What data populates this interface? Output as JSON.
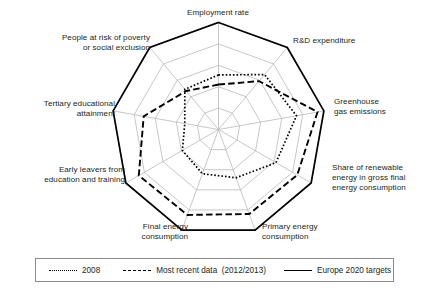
{
  "chart_data": {
    "type": "radar",
    "title": "",
    "axes": [
      "Employment rate",
      "R&D expenditure",
      "Greenhouse\ngas emissions",
      "Share of renewable\nenergy in gross final\nenergy consumption",
      "Primary energy\nconsumption",
      "Final energy\nconsumption",
      "Early leavers from\neducation and training",
      "Tertiary educational\nattainment",
      "People at risk of poverty\nor social exclusion"
    ],
    "rlim": [
      0,
      100
    ],
    "grid": true,
    "grid_rings": [
      20,
      40,
      60,
      80,
      100
    ],
    "legend_position": "bottom",
    "series": [
      {
        "name": "2008",
        "style": "dotted",
        "color": "#000000",
        "values": [
          51,
          67,
          74,
          62,
          48,
          44,
          39,
          32,
          49
        ]
      },
      {
        "name": "Most recent data  (2012/2013)",
        "style": "dashed",
        "color": "#000000",
        "values": [
          42,
          59,
          94,
          85,
          84,
          85,
          86,
          71,
          47
        ]
      },
      {
        "name": "Europe 2020 targets",
        "style": "solid",
        "color": "#000000",
        "values": [
          100,
          100,
          100,
          100,
          100,
          100,
          100,
          100,
          100
        ]
      }
    ]
  },
  "legend": {
    "items": [
      {
        "label": "2008",
        "swatch": "dotted-line-swatch"
      },
      {
        "label": "Most recent data  (2012/2013)",
        "swatch": "dashed-line-swatch"
      },
      {
        "label": "Europe 2020 targets",
        "swatch": "solid-line-swatch"
      }
    ]
  },
  "colors": {
    "ink": "#231f20",
    "grid": "#b9b9b9",
    "legend_border": "#8b8b8b"
  }
}
